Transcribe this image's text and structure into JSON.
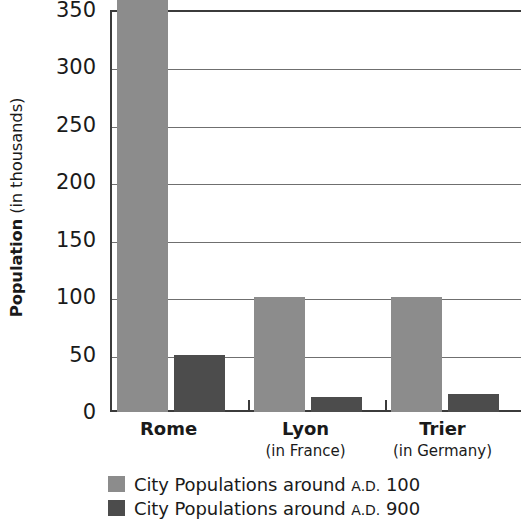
{
  "chart_data": {
    "type": "bar",
    "title": "",
    "subtitle": "",
    "xlabel": "",
    "ylabel": "Population (in thousands)",
    "ylabel_bold_part": "Population",
    "ylabel_regular_part": " (in thousands)",
    "ylim": [
      0,
      350
    ],
    "yticks": [
      0,
      50,
      100,
      150,
      200,
      250,
      300,
      350
    ],
    "ytick_labels": [
      "0",
      "50",
      "100",
      "150",
      "200",
      "250",
      "300",
      "350"
    ],
    "grid": "horizontal",
    "legend_position": "below",
    "categories": [
      "Rome",
      "Lyon",
      "Trier"
    ],
    "category_sublabels": [
      "",
      "(in France)",
      "(in Germany)"
    ],
    "series": [
      {
        "name": "City Populations around A.D. 100",
        "name_main": "City Populations around",
        "name_smallcaps": "A.D.",
        "name_year": "100",
        "color": "#8c8c8c",
        "values": [
          350,
          100,
          100
        ]
      },
      {
        "name": "City Populations around A.D. 900",
        "name_main": "City Populations around",
        "name_smallcaps": "A.D.",
        "name_year": "900",
        "color": "#4c4c4c",
        "values": [
          50,
          13,
          16
        ]
      }
    ]
  },
  "axis": {
    "axis_color": "#3b3b3b",
    "grid_color": "#6f6f6f"
  }
}
